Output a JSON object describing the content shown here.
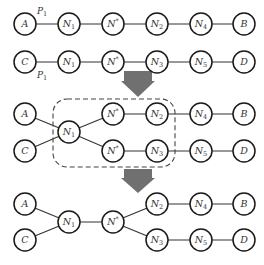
{
  "diagram": {
    "node_radius": 11,
    "colors": {
      "arrow": "#707070",
      "stroke": "#1a1a1a",
      "dashed_box": "#444444"
    },
    "panels": [
      {
        "id": "before",
        "nodes": [
          {
            "id": "A",
            "label": "A",
            "sub": "",
            "sup": "",
            "x": 25,
            "y": 24
          },
          {
            "id": "N1a",
            "label": "N",
            "sub": "1",
            "sup": "",
            "x": 69,
            "y": 24
          },
          {
            "id": "NSa",
            "label": "N",
            "sub": "",
            "sup": "*",
            "x": 113,
            "y": 24
          },
          {
            "id": "N2",
            "label": "N",
            "sub": "2",
            "sup": "",
            "x": 157,
            "y": 24
          },
          {
            "id": "N4",
            "label": "N",
            "sub": "4",
            "sup": "",
            "x": 201,
            "y": 24
          },
          {
            "id": "B",
            "label": "B",
            "sub": "",
            "sup": "",
            "x": 244,
            "y": 24
          },
          {
            "id": "C",
            "label": "C",
            "sub": "",
            "sup": "",
            "x": 25,
            "y": 62
          },
          {
            "id": "N1b",
            "label": "N",
            "sub": "1",
            "sup": "",
            "x": 69,
            "y": 62
          },
          {
            "id": "NSb",
            "label": "N",
            "sub": "",
            "sup": "*",
            "x": 113,
            "y": 62
          },
          {
            "id": "N3",
            "label": "N",
            "sub": "3",
            "sup": "",
            "x": 157,
            "y": 62
          },
          {
            "id": "N5",
            "label": "N",
            "sub": "5",
            "sup": "",
            "x": 201,
            "y": 62
          },
          {
            "id": "D",
            "label": "D",
            "sub": "",
            "sup": "",
            "x": 244,
            "y": 62
          }
        ],
        "edges": [
          [
            "A",
            "N1a"
          ],
          [
            "N1a",
            "NSa"
          ],
          [
            "NSa",
            "N2"
          ],
          [
            "N2",
            "N4"
          ],
          [
            "N4",
            "B"
          ],
          [
            "C",
            "N1b"
          ],
          [
            "N1b",
            "NSb"
          ],
          [
            "NSb",
            "N3"
          ],
          [
            "N3",
            "N5"
          ],
          [
            "N5",
            "D"
          ]
        ],
        "path_labels": [
          {
            "text": "P",
            "sub": "1",
            "x": 37,
            "y": 14
          },
          {
            "text": "P",
            "sub": "1",
            "x": 37,
            "y": 78
          }
        ]
      },
      {
        "id": "intermediate",
        "nodes": [
          {
            "id": "A",
            "label": "A",
            "sub": "",
            "sup": "",
            "x": 25,
            "y": 114
          },
          {
            "id": "C",
            "label": "C",
            "sub": "",
            "sup": "",
            "x": 25,
            "y": 151
          },
          {
            "id": "N1",
            "label": "N",
            "sub": "1",
            "sup": "",
            "x": 69,
            "y": 132
          },
          {
            "id": "NSa",
            "label": "N",
            "sub": "",
            "sup": "*",
            "x": 113,
            "y": 114
          },
          {
            "id": "NSb",
            "label": "N",
            "sub": "",
            "sup": "*",
            "x": 113,
            "y": 151
          },
          {
            "id": "N2",
            "label": "N",
            "sub": "2",
            "sup": "",
            "x": 157,
            "y": 114
          },
          {
            "id": "N3",
            "label": "N",
            "sub": "3",
            "sup": "",
            "x": 157,
            "y": 151
          },
          {
            "id": "N4",
            "label": "N",
            "sub": "4",
            "sup": "",
            "x": 201,
            "y": 114
          },
          {
            "id": "N5",
            "label": "N",
            "sub": "5",
            "sup": "",
            "x": 201,
            "y": 151
          },
          {
            "id": "B",
            "label": "B",
            "sub": "",
            "sup": "",
            "x": 244,
            "y": 114
          },
          {
            "id": "D",
            "label": "D",
            "sub": "",
            "sup": "",
            "x": 244,
            "y": 151
          }
        ],
        "edges": [
          [
            "A",
            "N1"
          ],
          [
            "C",
            "N1"
          ],
          [
            "N1",
            "NSa"
          ],
          [
            "N1",
            "NSb"
          ],
          [
            "NSa",
            "N2"
          ],
          [
            "NSb",
            "N3"
          ],
          [
            "N2",
            "N4"
          ],
          [
            "N3",
            "N5"
          ],
          [
            "N4",
            "B"
          ],
          [
            "N5",
            "D"
          ]
        ],
        "dashed_box": {
          "x": 53,
          "y": 99,
          "width": 122,
          "height": 68,
          "rx": 14
        }
      },
      {
        "id": "after",
        "nodes": [
          {
            "id": "A",
            "label": "A",
            "sub": "",
            "sup": "",
            "x": 25,
            "y": 204
          },
          {
            "id": "C",
            "label": "C",
            "sub": "",
            "sup": "",
            "x": 25,
            "y": 240
          },
          {
            "id": "N1",
            "label": "N",
            "sub": "1",
            "sup": "",
            "x": 69,
            "y": 222
          },
          {
            "id": "NS",
            "label": "N",
            "sub": "",
            "sup": "*",
            "x": 113,
            "y": 222
          },
          {
            "id": "N2",
            "label": "N",
            "sub": "2",
            "sup": "",
            "x": 157,
            "y": 204
          },
          {
            "id": "N3",
            "label": "N",
            "sub": "3",
            "sup": "",
            "x": 157,
            "y": 240
          },
          {
            "id": "N4",
            "label": "N",
            "sub": "4",
            "sup": "",
            "x": 201,
            "y": 204
          },
          {
            "id": "N5",
            "label": "N",
            "sub": "5",
            "sup": "",
            "x": 201,
            "y": 240
          },
          {
            "id": "B",
            "label": "B",
            "sub": "",
            "sup": "",
            "x": 244,
            "y": 204
          },
          {
            "id": "D",
            "label": "D",
            "sub": "",
            "sup": "",
            "x": 244,
            "y": 240
          }
        ],
        "edges": [
          [
            "A",
            "N1"
          ],
          [
            "C",
            "N1"
          ],
          [
            "N1",
            "NS"
          ],
          [
            "NS",
            "N2"
          ],
          [
            "NS",
            "N3"
          ],
          [
            "N2",
            "N4"
          ],
          [
            "N3",
            "N5"
          ],
          [
            "N4",
            "B"
          ],
          [
            "N5",
            "D"
          ]
        ]
      }
    ],
    "arrows": [
      {
        "cx": 138,
        "top": 71,
        "shaft_bottom": 81,
        "tip": 97,
        "shaft_half": 14,
        "head_half": 17
      },
      {
        "cx": 138,
        "top": 169,
        "shaft_bottom": 178,
        "tip": 193,
        "shaft_half": 14,
        "head_half": 17
      }
    ]
  }
}
